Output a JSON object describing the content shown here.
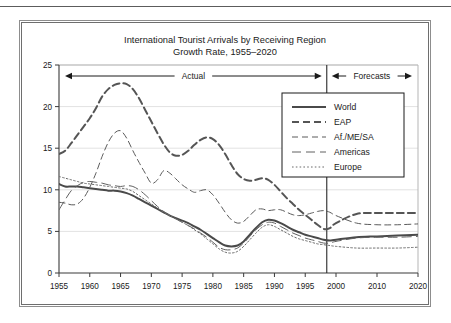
{
  "figure": {
    "title_line1": "International Tourist Arrivals by Receiving Region",
    "title_line2": "Growth Rate, 1955–2020",
    "annotation_actual": "Actual",
    "annotation_forecasts": "Forecasts"
  },
  "chart_data": {
    "type": "line",
    "title": "International Tourist Arrivals by Receiving Region Growth Rate, 1955–2020",
    "xlabel": "",
    "ylabel": "",
    "xlim": [
      1955,
      2020
    ],
    "ylim": [
      0,
      25
    ],
    "grid": true,
    "legend_position": "upper-right",
    "yticks": [
      "0",
      "5",
      "10",
      "15",
      "20",
      "25"
    ],
    "xticks": [
      "1955",
      "1960",
      "1965",
      "1970",
      "1975",
      "1980",
      "1985",
      "1990",
      "1995",
      "2000",
      "2010",
      "2020"
    ],
    "divider_year": 1998.5,
    "x": [
      1955,
      1956,
      1957,
      1958,
      1959,
      1960,
      1961,
      1962,
      1963,
      1964,
      1965,
      1966,
      1967,
      1968,
      1969,
      1970,
      1971,
      1972,
      1973,
      1974,
      1975,
      1976,
      1977,
      1978,
      1979,
      1980,
      1981,
      1982,
      1983,
      1984,
      1985,
      1986,
      1987,
      1988,
      1989,
      1990,
      1991,
      1992,
      1993,
      1994,
      1995,
      1996,
      1997,
      1998,
      1999,
      2000,
      2005,
      2010,
      2015,
      2020
    ],
    "series": [
      {
        "name": "World",
        "style": "solid-thick",
        "color": "#4a4a4a",
        "values": [
          10.7,
          10.4,
          10.4,
          10.4,
          10.3,
          10.2,
          10.1,
          10.0,
          9.9,
          9.9,
          9.8,
          9.6,
          9.3,
          8.9,
          8.5,
          8.1,
          7.7,
          7.3,
          6.9,
          6.6,
          6.3,
          6.0,
          5.6,
          5.2,
          4.7,
          4.2,
          3.7,
          3.3,
          3.2,
          3.3,
          3.8,
          4.6,
          5.4,
          6.1,
          6.4,
          6.3,
          6.0,
          5.6,
          5.2,
          4.9,
          4.6,
          4.4,
          4.2,
          4.0,
          3.9,
          4.0,
          4.3,
          4.4,
          4.5,
          4.6
        ]
      },
      {
        "name": "EAP",
        "style": "dash-thick",
        "color": "#555555",
        "values": [
          14.3,
          14.7,
          15.6,
          16.6,
          17.6,
          18.6,
          19.8,
          21.2,
          22.1,
          22.6,
          22.8,
          22.7,
          22.1,
          21.0,
          19.6,
          18.2,
          16.8,
          15.5,
          14.5,
          14.1,
          14.2,
          14.7,
          15.4,
          16.0,
          16.3,
          16.1,
          15.4,
          14.3,
          13.0,
          11.9,
          11.3,
          11.1,
          11.2,
          11.4,
          11.2,
          10.6,
          9.8,
          9.0,
          8.3,
          7.6,
          7.0,
          6.4,
          5.8,
          5.3,
          5.4,
          6.0,
          7.1,
          7.2,
          7.2,
          7.2
        ]
      },
      {
        "name": "Af./ME/SA",
        "style": "dash-thin",
        "color": "#5a5a5a",
        "values": [
          8.5,
          8.4,
          8.2,
          8.3,
          9.0,
          10.3,
          12.0,
          14.0,
          15.7,
          16.8,
          17.1,
          16.2,
          14.7,
          13.3,
          12.0,
          10.8,
          11.2,
          12.3,
          12.0,
          11.3,
          10.6,
          10.1,
          9.7,
          9.9,
          10.0,
          9.4,
          8.4,
          7.3,
          6.4,
          6.0,
          6.2,
          6.9,
          7.6,
          7.7,
          7.5,
          7.6,
          7.6,
          7.3,
          7.0,
          6.9,
          7.0,
          7.2,
          7.4,
          7.5,
          7.3,
          6.9,
          6.0,
          5.8,
          5.8,
          5.9
        ]
      },
      {
        "name": "Americas",
        "style": "dash-long",
        "color": "#606060",
        "values": [
          7.6,
          8.8,
          9.9,
          10.5,
          10.9,
          11.0,
          10.9,
          10.8,
          10.6,
          10.5,
          10.4,
          10.5,
          10.4,
          10.0,
          9.4,
          8.7,
          8.0,
          7.4,
          6.9,
          6.5,
          6.1,
          5.7,
          5.3,
          4.8,
          4.3,
          3.7,
          3.1,
          2.8,
          2.8,
          3.0,
          3.6,
          4.4,
          5.2,
          5.8,
          6.1,
          6.0,
          5.6,
          5.2,
          4.8,
          4.5,
          4.2,
          4.0,
          3.8,
          3.6,
          3.6,
          3.8,
          4.2,
          4.3,
          4.3,
          4.4
        ]
      },
      {
        "name": "Europe",
        "style": "dotted",
        "color": "#6a6a6a",
        "values": [
          11.6,
          11.4,
          11.2,
          11.0,
          10.8,
          10.7,
          10.6,
          10.5,
          10.4,
          10.3,
          10.2,
          10.1,
          9.8,
          9.3,
          8.8,
          8.3,
          7.8,
          7.3,
          6.9,
          6.5,
          6.1,
          5.7,
          5.2,
          4.7,
          4.1,
          3.5,
          2.9,
          2.5,
          2.4,
          2.6,
          3.2,
          4.0,
          4.8,
          5.5,
          5.8,
          5.6,
          5.2,
          4.8,
          4.4,
          4.1,
          3.9,
          3.7,
          3.5,
          3.4,
          3.3,
          3.2,
          3.0,
          3.0,
          3.0,
          3.1
        ]
      }
    ]
  },
  "legend": {
    "items": [
      {
        "label": "World"
      },
      {
        "label": "EAP"
      },
      {
        "label": "Af./ME/SA"
      },
      {
        "label": "Americas"
      },
      {
        "label": "Europe"
      }
    ]
  }
}
